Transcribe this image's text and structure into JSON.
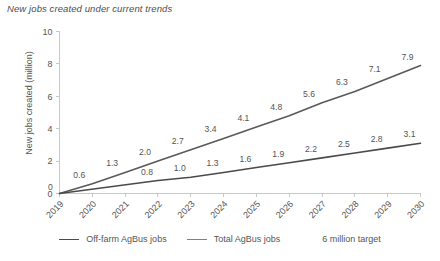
{
  "chart_data": {
    "type": "line",
    "title": "New jobs created under current trends",
    "xlabel": "",
    "ylabel": "New jobs created (million)",
    "x": [
      "2019",
      "2020",
      "2021",
      "2022",
      "2023",
      "2024",
      "2025",
      "2026",
      "2027",
      "2028",
      "2029",
      "2030"
    ],
    "categories": [
      "2019",
      "2020",
      "2021",
      "2022",
      "2023",
      "2024",
      "2025",
      "2026",
      "2027",
      "2028",
      "2029",
      "2030"
    ],
    "ylim": [
      0,
      10
    ],
    "yticks": [
      "0",
      "2",
      "4",
      "6",
      "8",
      "10"
    ],
    "ytick_values": [
      0,
      2,
      4,
      6,
      8,
      10
    ],
    "grid": false,
    "legend_position": "bottom",
    "series": [
      {
        "name": "Total AgBus jobs",
        "color": "#595959",
        "values": [
          0,
          0.6,
          1.3,
          2.0,
          2.7,
          3.4,
          4.1,
          4.8,
          5.6,
          6.3,
          7.1,
          7.9
        ],
        "labels": [
          "0",
          "0.6",
          "1.3",
          "2.0",
          "2.7",
          "3.4",
          "4.1",
          "4.8",
          "5.6",
          "6.3",
          "7.1",
          "7.9"
        ]
      },
      {
        "name": "Off-farm AgBus jobs",
        "color": "#4a4a4a",
        "values": [
          0,
          null,
          null,
          0.8,
          1.0,
          1.3,
          1.6,
          1.9,
          2.2,
          2.5,
          2.8,
          3.1
        ],
        "labels": [
          "",
          "",
          "",
          "0.8",
          "1.0",
          "1.3",
          "1.6",
          "1.9",
          "2.2",
          "2.5",
          "2.8",
          "3.1"
        ]
      }
    ],
    "annotations": [
      "6 million target"
    ]
  },
  "legend": {
    "items": [
      {
        "label": "Off-farm AgBus jobs",
        "color": "#4a4a4a",
        "has_marker": true
      },
      {
        "label": "Total AgBus jobs",
        "color": "#808080",
        "has_marker": true
      },
      {
        "label": "6 million target",
        "color": "#555555",
        "has_marker": false
      }
    ]
  },
  "colors": {
    "axis": "#c8c8c8",
    "text": "#555555",
    "off_farm_line": "#4a4a4a",
    "total_line": "#595959",
    "background": "#ffffff"
  }
}
